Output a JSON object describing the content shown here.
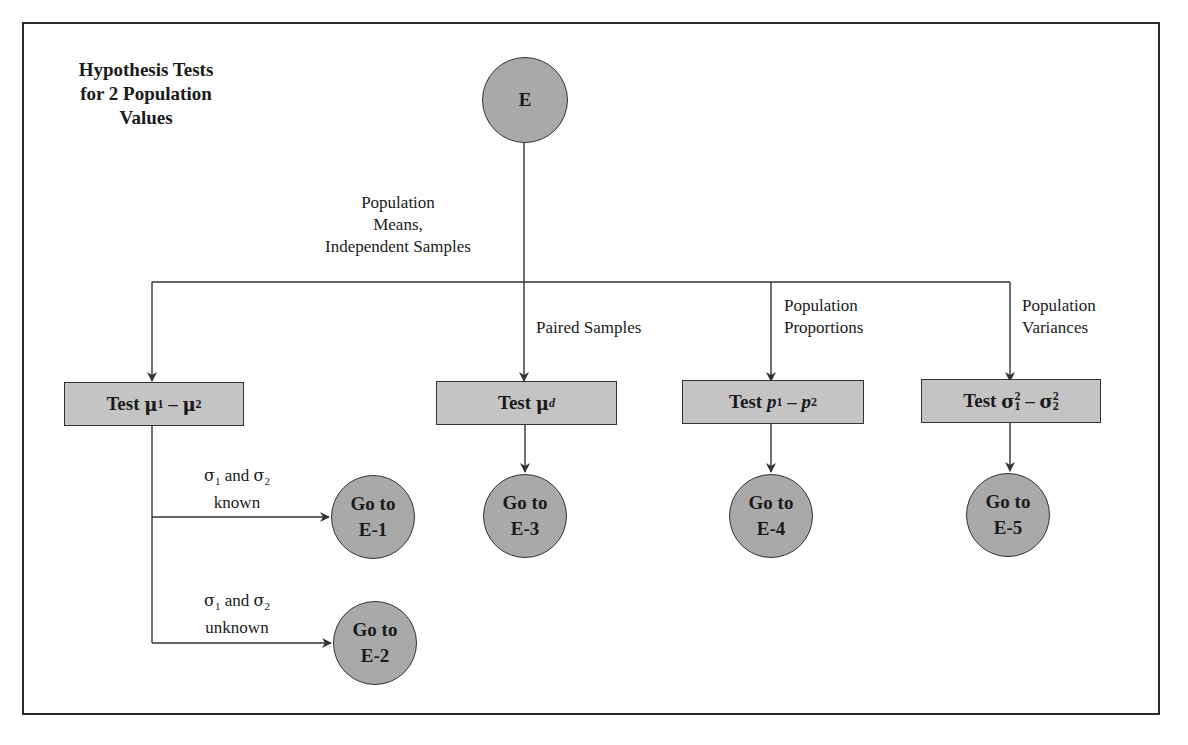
{
  "title": {
    "line1": "Hypothesis Tests",
    "line2": "for 2 Population",
    "line3": "Values"
  },
  "root": {
    "label": "E"
  },
  "branches": {
    "independent": {
      "line1": "Population",
      "line2": "Means,",
      "line3": "Independent Samples"
    },
    "paired": {
      "line1": "Paired Samples"
    },
    "proportions": {
      "line1": "Population",
      "line2": "Proportions"
    },
    "variances": {
      "line1": "Population",
      "line2": "Variances"
    }
  },
  "boxes": {
    "means": {
      "prefix": "Test ",
      "a": "μ",
      "a_sub": "1",
      "op": " – ",
      "b": "μ",
      "b_sub": "2"
    },
    "paired": {
      "prefix": "Test ",
      "a": "μ",
      "a_sub": "d"
    },
    "proportions": {
      "prefix": "Test ",
      "a": "p",
      "a_sub": "1",
      "op": " – ",
      "b": "p",
      "b_sub": "2"
    },
    "variances": {
      "prefix": "Test ",
      "a": "σ",
      "a_sub": "1",
      "a_sup": "2",
      "op": " – ",
      "b": "σ",
      "b_sub": "2",
      "b_sup": "2"
    }
  },
  "conditions": {
    "known": {
      "s1": "σ",
      "s1_sub": "1",
      "and": " and ",
      "s2": "σ",
      "s2_sub": "2",
      "line2": "known"
    },
    "unknown": {
      "s1": "σ",
      "s1_sub": "1",
      "and": " and ",
      "s2": "σ",
      "s2_sub": "2",
      "line2": "unknown"
    }
  },
  "goto": {
    "e1": {
      "line1": "Go to",
      "line2": "E-1"
    },
    "e2": {
      "line1": "Go to",
      "line2": "E-2"
    },
    "e3": {
      "line1": "Go to",
      "line2": "E-3"
    },
    "e4": {
      "line1": "Go to",
      "line2": "E-4"
    },
    "e5": {
      "line1": "Go to",
      "line2": "E-5"
    }
  },
  "colors": {
    "node_fill": "#a9a9a9",
    "box_fill": "#c4c4c4",
    "line": "#333333",
    "frame": "#2a2a2a"
  }
}
